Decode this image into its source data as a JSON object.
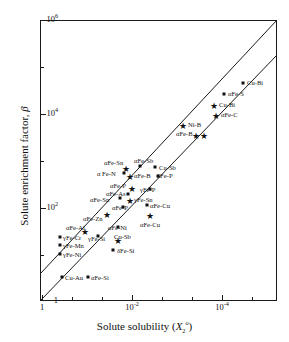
{
  "chart_data": {
    "type": "scatter",
    "title": "",
    "xlabel": "Solute solubility (X2o)",
    "ylabel": "Solute enrichment factor, β",
    "xlabel_parts": {
      "main": "Solute solubility (",
      "sym": "X",
      "sub": "2",
      "sup": "o",
      "close": ")"
    },
    "ylabel_parts": {
      "main": "Solute enrichment factor, ",
      "sym": "β"
    },
    "xscale": "log",
    "yscale": "log",
    "x_inverted": true,
    "xlim": [
      2.0,
      2e-05
    ],
    "ylim": [
      1,
      1000000
    ],
    "grid": false,
    "legend": null,
    "x_ticks": [
      {
        "label": "1",
        "exp": null,
        "value": 1,
        "minor": false
      },
      {
        "label": "",
        "exp": null,
        "value": 0.01,
        "minor": true
      },
      {
        "label": "",
        "exp": null,
        "value": 0.0001,
        "minor": true
      },
      {
        "label": "10",
        "exp": "-2",
        "value": 0.01,
        "minor": false
      },
      {
        "label": "10",
        "exp": "-4",
        "value": 0.0001,
        "minor": false
      }
    ],
    "x_tick_display": [
      {
        "text": "1",
        "exp": "",
        "px": 42,
        "minor": false
      },
      {
        "text": "",
        "exp": "",
        "px": 72,
        "minor": true
      },
      {
        "text": "",
        "exp": "",
        "px": 102,
        "minor": true
      },
      {
        "text": "10",
        "exp": "-2",
        "px": 132,
        "minor": false
      },
      {
        "text": "",
        "exp": "",
        "px": 162,
        "minor": true
      },
      {
        "text": "",
        "exp": "",
        "px": 192,
        "minor": true
      },
      {
        "text": "10",
        "exp": "-4",
        "px": 222,
        "minor": false
      },
      {
        "text": "",
        "exp": "",
        "px": 252,
        "minor": true
      }
    ],
    "y_tick_display": [
      {
        "text": "10",
        "exp": "6",
        "px": 20,
        "minor": false
      },
      {
        "text": "",
        "exp": "",
        "px": 67,
        "minor": true
      },
      {
        "text": "10",
        "exp": "4",
        "px": 114,
        "minor": false
      },
      {
        "text": "",
        "exp": "",
        "px": 161,
        "minor": true
      },
      {
        "text": "10",
        "exp": "2",
        "px": 208,
        "minor": false
      },
      {
        "text": "",
        "exp": "",
        "px": 255,
        "minor": true
      },
      {
        "text": "1",
        "exp": "",
        "px": 301,
        "minor": false
      }
    ],
    "reference_lines": [
      {
        "name": "upper-trend-line",
        "x1": 41,
        "y1": 273,
        "x2": 277,
        "y2": 20
      },
      {
        "name": "lower-trend-line",
        "x1": 41,
        "y1": 300,
        "x2": 277,
        "y2": 55
      }
    ],
    "points": [
      {
        "label": "Cu-Bi",
        "marker": "square",
        "px": 243,
        "py": 83,
        "lx": 247,
        "ly": 80,
        "x": 3e-05,
        "y": 40000
      },
      {
        "label": "αFe-S",
        "marker": "square",
        "px": 224,
        "py": 94,
        "lx": 228,
        "ly": 91,
        "x": 0.0001,
        "y": 22000
      },
      {
        "label": "Cu-Bi",
        "marker": "star",
        "px": 214,
        "py": 104,
        "lx": 219,
        "ly": 102,
        "x": 0.0002,
        "y": 14000
      },
      {
        "label": "αFe-C",
        "marker": "star",
        "px": 216,
        "py": 114,
        "lx": 221,
        "ly": 112,
        "x": 0.00018,
        "y": 9000
      },
      {
        "label": "Ni-B",
        "marker": "star",
        "px": 183,
        "py": 124,
        "lx": 188,
        "ly": 122,
        "x": 0.0016,
        "y": 6000
      },
      {
        "label": "αFe-B",
        "marker": "star",
        "px": 204,
        "py": 134,
        "lx": 176,
        "ly": 131,
        "x": 0.0004,
        "y": 3600
      },
      {
        "label": "",
        "marker": "star",
        "px": 196,
        "py": 134,
        "lx": 0,
        "ly": 0,
        "x": 0.0006,
        "y": 3600
      },
      {
        "label": "αFe-Sb",
        "marker": "square",
        "px": 140,
        "py": 166,
        "lx": 134,
        "ly": 158,
        "x": 0.016,
        "y": 800
      },
      {
        "label": "Cu-Sb",
        "marker": "square",
        "px": 155,
        "py": 167,
        "lx": 159,
        "ly": 165,
        "x": 0.008,
        "y": 760
      },
      {
        "label": "αFe-Sn",
        "marker": "star",
        "px": 126,
        "py": 167,
        "lx": 104,
        "ly": 160,
        "x": 0.032,
        "y": 760
      },
      {
        "label": "α Fe-N",
        "marker": "square",
        "px": 124,
        "py": 173,
        "lx": 97,
        "ly": 171,
        "x": 0.036,
        "y": 600
      },
      {
        "label": "αFe-B",
        "marker": "star",
        "px": 130,
        "py": 175,
        "lx": 134,
        "ly": 173,
        "x": 0.026,
        "y": 560
      },
      {
        "label": "δFe-P",
        "marker": "square",
        "px": 158,
        "py": 176,
        "lx": 157,
        "ly": 173,
        "x": 0.007,
        "y": 540
      },
      {
        "label": "αFe-P",
        "marker": "star",
        "px": 132,
        "py": 187,
        "lx": 110,
        "ly": 183,
        "x": 0.024,
        "y": 340
      },
      {
        "label": "γFe-P",
        "marker": "square",
        "px": 150,
        "py": 189,
        "lx": 140,
        "ly": 187,
        "x": 0.01,
        "y": 310
      },
      {
        "label": "αFe-As",
        "marker": "square",
        "px": 128,
        "py": 194,
        "lx": 106,
        "ly": 191,
        "x": 0.028,
        "y": 250
      },
      {
        "label": "γFe-Sn",
        "marker": "star",
        "px": 130,
        "py": 199,
        "lx": 134,
        "ly": 197,
        "x": 0.026,
        "y": 215
      },
      {
        "label": "αFe-Sn",
        "marker": "square",
        "px": 120,
        "py": 198,
        "lx": 90,
        "ly": 197,
        "x": 0.045,
        "y": 220
      },
      {
        "label": "αFe-P",
        "marker": "square",
        "px": 123,
        "py": 207,
        "lx": 112,
        "ly": 205,
        "x": 0.04,
        "y": 160
      },
      {
        "label": "αFe-Cu",
        "marker": "square",
        "px": 147,
        "py": 205,
        "lx": 150,
        "ly": 203,
        "x": 0.011,
        "y": 175
      },
      {
        "label": "αFe-Cu",
        "marker": "star",
        "px": 150,
        "py": 214,
        "lx": 140,
        "ly": 222,
        "x": 0.01,
        "y": 120
      },
      {
        "label": "αFe-Zn",
        "marker": "star",
        "px": 107,
        "py": 213,
        "lx": 83,
        "ly": 216,
        "x": 0.08,
        "y": 125
      },
      {
        "label": "αFe-Ni",
        "marker": "square",
        "px": 118,
        "py": 227,
        "lx": 108,
        "ly": 225,
        "x": 0.05,
        "y": 65
      },
      {
        "label": "αFe-Al",
        "marker": "star",
        "px": 85,
        "py": 230,
        "lx": 66,
        "ly": 225,
        "x": 0.2,
        "y": 58
      },
      {
        "label": "γFe-Cr",
        "marker": "square",
        "px": 60,
        "py": 237,
        "lx": 63,
        "ly": 235,
        "x": 0.9,
        "y": 46
      },
      {
        "label": "γFe-Si",
        "marker": "square",
        "px": 98,
        "py": 236,
        "lx": 88,
        "ly": 236,
        "x": 0.12,
        "y": 48
      },
      {
        "label": "Cu-Sb",
        "marker": "star",
        "px": 118,
        "py": 239,
        "lx": 114,
        "ly": 234,
        "x": 0.05,
        "y": 42
      },
      {
        "label": "γFe-Mn",
        "marker": "square",
        "px": 60,
        "py": 245,
        "lx": 63,
        "ly": 243,
        "x": 0.9,
        "y": 33
      },
      {
        "label": "δFe-Si",
        "marker": "square",
        "px": 113,
        "py": 250,
        "lx": 117,
        "ly": 248,
        "x": 0.06,
        "y": 26
      },
      {
        "label": "γFe-Ni",
        "marker": "square",
        "px": 60,
        "py": 254,
        "lx": 63,
        "ly": 252,
        "x": 0.9,
        "y": 23
      },
      {
        "label": "Cu-Au",
        "marker": "square",
        "px": 62,
        "py": 277,
        "lx": 65,
        "ly": 275,
        "x": 0.8,
        "y": 7
      },
      {
        "label": "αFe-Si",
        "marker": "square",
        "px": 88,
        "py": 277,
        "lx": 91,
        "ly": 275,
        "x": 0.2,
        "y": 7
      }
    ]
  }
}
